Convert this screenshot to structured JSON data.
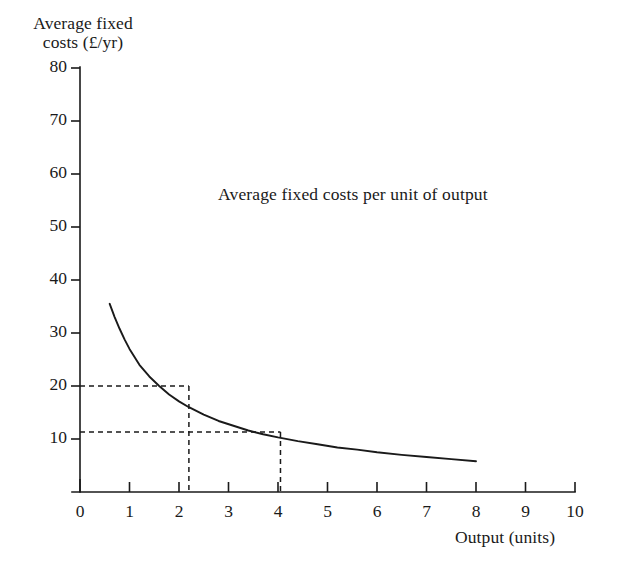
{
  "figure": {
    "background_color": "#ffffff",
    "ink_color": "#1a1a1a"
  },
  "chart_data": {
    "type": "line",
    "title": "",
    "annotation": "Average fixed costs per unit of output",
    "xlabel": "Output (units)",
    "ylabel": "Average fixed\ncosts (£/yr)",
    "ylabel_lines": [
      "Average fixed",
      "costs (£/yr)"
    ],
    "xlim": [
      0,
      10
    ],
    "ylim": [
      0,
      80
    ],
    "xticks": [
      0,
      1,
      2,
      3,
      4,
      5,
      6,
      7,
      8,
      9,
      10
    ],
    "xtick_labels": [
      "0",
      "1",
      "2",
      "3",
      "4",
      "5",
      "6",
      "7",
      "8",
      "9",
      "10"
    ],
    "yticks": [
      10,
      20,
      30,
      40,
      50,
      60,
      70,
      80
    ],
    "ytick_labels": [
      "10",
      "20",
      "30",
      "40",
      "50",
      "60",
      "70",
      "80"
    ],
    "grid": false,
    "legend": false,
    "curve_formula": "AFC = 44 / Q",
    "series": [
      {
        "name": "Average fixed costs per unit of output",
        "x": [
          0.6,
          0.7,
          0.8,
          0.9,
          1.0,
          1.2,
          1.4,
          1.6,
          1.8,
          2.0,
          2.2,
          2.5,
          2.8,
          3.1,
          3.4,
          3.7,
          4.0,
          4.4,
          4.8,
          5.2,
          5.6,
          6.0,
          6.5,
          7.0,
          7.5,
          8.0
        ],
        "y": [
          35.5,
          33.0,
          30.8,
          28.8,
          27.0,
          24.0,
          21.8,
          20.0,
          18.4,
          17.1,
          16.0,
          14.6,
          13.4,
          12.5,
          11.6,
          10.9,
          10.3,
          9.6,
          9.0,
          8.4,
          8.0,
          7.5,
          7.0,
          6.6,
          6.2,
          5.8
        ]
      }
    ],
    "guide_lines": [
      {
        "label": "guide-upper",
        "x": 2.2,
        "y": 20.0,
        "style": "dashed"
      },
      {
        "label": "guide-lower",
        "x": 4.05,
        "y": 11.3,
        "style": "dashed"
      }
    ]
  }
}
